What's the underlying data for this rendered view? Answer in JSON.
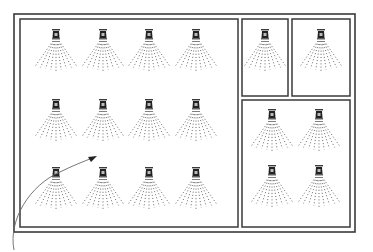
{
  "diagram": {
    "colors": {
      "line": "#3a3a3a",
      "spray": "#555555",
      "background": "#ffffff"
    },
    "outer_frame": {
      "x": 14,
      "y": 14,
      "w": 341,
      "h": 218
    },
    "rooms": [
      {
        "id": "main-room",
        "x": 20,
        "y": 19,
        "w": 218,
        "h": 208,
        "sprinklers": [
          [
            56,
            30
          ],
          [
            103,
            30
          ],
          [
            149,
            30
          ],
          [
            196,
            30
          ],
          [
            56,
            100
          ],
          [
            103,
            100
          ],
          [
            149,
            100
          ],
          [
            196,
            100
          ],
          [
            56,
            168
          ],
          [
            103,
            168
          ],
          [
            149,
            168
          ],
          [
            196,
            168
          ]
        ]
      },
      {
        "id": "small-room-1",
        "x": 242,
        "y": 19,
        "w": 46,
        "h": 77,
        "sprinklers": [
          [
            265,
            30
          ]
        ]
      },
      {
        "id": "small-room-2",
        "x": 292,
        "y": 19,
        "w": 58,
        "h": 77,
        "sprinklers": [
          [
            321,
            30
          ]
        ]
      },
      {
        "id": "room-4",
        "x": 242,
        "y": 100,
        "w": 108,
        "h": 127,
        "sprinklers": [
          [
            272,
            110
          ],
          [
            319,
            110
          ],
          [
            272,
            166
          ],
          [
            319,
            166
          ]
        ]
      }
    ],
    "pointer_arrow": {
      "path": "M 14 250 C 8 220, 30 185, 60 172 C 72 166, 82 162, 95 157",
      "head": [
        97,
        156
      ]
    }
  }
}
